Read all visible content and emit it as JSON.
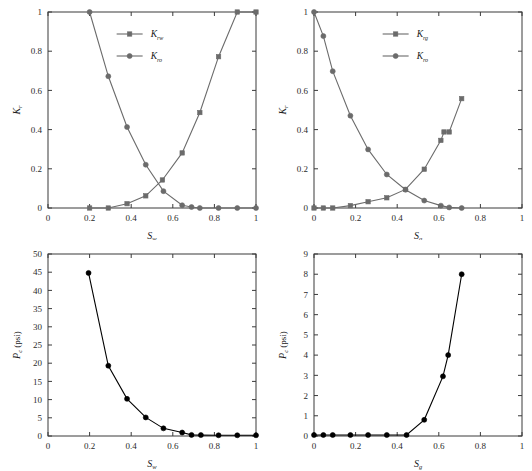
{
  "figure": {
    "panels": [
      "top-left",
      "top-right",
      "bottom-left",
      "bottom-right"
    ]
  },
  "chart_data": [
    {
      "id": "water-oil-relative-permeability",
      "type": "line",
      "title": "",
      "xlabel": "S",
      "xlabel_sub": "w",
      "ylabel": "K",
      "ylabel_sub": "r",
      "xlim": [
        0,
        1
      ],
      "ylim": [
        0,
        1
      ],
      "xticks": [
        0,
        0.2,
        0.4,
        0.6,
        0.8,
        1
      ],
      "xticklabels": [
        "0",
        "0.2",
        "0.4",
        "0.6",
        "0.8",
        "1"
      ],
      "yticks": [
        0,
        0.2,
        0.4,
        0.6,
        0.8,
        1
      ],
      "yticklabels": [
        "0",
        "0.2",
        "0.4",
        "0.6",
        "0.8",
        "1"
      ],
      "grid": false,
      "legend_position": "upper-center",
      "series": [
        {
          "name": "K",
          "name_sub": "rw",
          "marker": "square",
          "color": "#6b6b6b",
          "x": [
            0.2,
            0.29,
            0.38,
            0.47,
            0.55,
            0.645,
            0.73,
            0.82,
            0.91,
            1.0
          ],
          "y": [
            0.0,
            0.0,
            0.022,
            0.062,
            0.143,
            0.281,
            0.487,
            0.772,
            1.0,
            1.0
          ]
        },
        {
          "name": "K",
          "name_sub": "ro",
          "marker": "circle",
          "color": "#6b6b6b",
          "x": [
            0.2,
            0.29,
            0.38,
            0.47,
            0.555,
            0.645,
            0.69,
            0.73,
            0.82,
            0.91,
            1.0
          ],
          "y": [
            1.0,
            0.672,
            0.413,
            0.221,
            0.086,
            0.014,
            0.005,
            0.0,
            0.0,
            0.0,
            0.0
          ]
        }
      ]
    },
    {
      "id": "gas-oil-relative-permeability",
      "type": "line",
      "title": "",
      "xlabel": "S",
      "xlabel_sub": "g",
      "ylabel": "K",
      "ylabel_sub": "r",
      "xlim": [
        0,
        1
      ],
      "ylim": [
        0,
        1
      ],
      "xticks": [
        0,
        0.2,
        0.4,
        0.6,
        0.8,
        1
      ],
      "xticklabels": [
        "0",
        "0.2",
        "0.4",
        "0.6",
        "0.8",
        "1"
      ],
      "yticks": [
        0,
        0.2,
        0.4,
        0.6,
        0.8,
        1
      ],
      "yticklabels": [
        "0",
        "0.2",
        "0.4",
        "0.6",
        "0.8",
        "1"
      ],
      "grid": false,
      "legend_position": "upper-center",
      "series": [
        {
          "name": "K",
          "name_sub": "rg",
          "marker": "square",
          "color": "#6b6b6b",
          "x": [
            0.0,
            0.045,
            0.09,
            0.175,
            0.26,
            0.35,
            0.44,
            0.53,
            0.61,
            0.625,
            0.65,
            0.71
          ],
          "y": [
            0.0,
            0.0,
            0.0,
            0.012,
            0.032,
            0.052,
            0.095,
            0.198,
            0.345,
            0.388,
            0.388,
            0.558
          ]
        },
        {
          "name": "K",
          "name_sub": "ro",
          "marker": "circle",
          "color": "#6b6b6b",
          "x": [
            0.0,
            0.045,
            0.09,
            0.175,
            0.26,
            0.35,
            0.44,
            0.53,
            0.61,
            0.65,
            0.71
          ],
          "y": [
            1.0,
            0.877,
            0.698,
            0.471,
            0.299,
            0.171,
            0.093,
            0.038,
            0.012,
            0.003,
            0.0
          ]
        }
      ]
    },
    {
      "id": "water-capillary-pressure",
      "type": "line",
      "title": "",
      "xlabel": "S",
      "xlabel_sub": "w",
      "ylabel": "P",
      "ylabel_sub": "c",
      "yunit": "(psi)",
      "xlim": [
        0,
        1
      ],
      "ylim": [
        0,
        50
      ],
      "xticks": [
        0,
        0.2,
        0.4,
        0.6,
        0.8,
        1
      ],
      "xticklabels": [
        "0",
        "0.2",
        "0.4",
        "0.6",
        "0.8",
        "1"
      ],
      "yticks": [
        0,
        5,
        10,
        15,
        20,
        25,
        30,
        35,
        40,
        45,
        50
      ],
      "yticklabels": [
        "0",
        "5",
        "10",
        "15",
        "20",
        "25",
        "30",
        "35",
        "40",
        "45",
        "50"
      ],
      "grid": false,
      "legend_position": "none",
      "series": [
        {
          "name": "Pc",
          "marker": "circle",
          "color": "#000000",
          "x": [
            0.195,
            0.29,
            0.38,
            0.47,
            0.555,
            0.645,
            0.69,
            0.735,
            0.82,
            0.91,
            1.0
          ],
          "y": [
            44.8,
            19.3,
            10.2,
            5.1,
            2.1,
            0.95,
            0.3,
            0.25,
            0.2,
            0.2,
            0.2
          ]
        }
      ]
    },
    {
      "id": "gas-capillary-pressure",
      "type": "line",
      "title": "",
      "xlabel": "S",
      "xlabel_sub": "g",
      "ylabel": "P",
      "ylabel_sub": "c",
      "yunit": "(psi)",
      "xlim": [
        0,
        1
      ],
      "ylim": [
        0,
        9
      ],
      "xticks": [
        0,
        0.2,
        0.4,
        0.6,
        0.8,
        1
      ],
      "xticklabels": [
        "0",
        "0.2",
        "0.4",
        "0.6",
        "0.8",
        "1"
      ],
      "yticks": [
        0,
        1,
        2,
        3,
        4,
        5,
        6,
        7,
        8,
        9
      ],
      "yticklabels": [
        "0",
        "1",
        "2",
        "3",
        "4",
        "5",
        "6",
        "7",
        "8",
        "9"
      ],
      "grid": false,
      "legend_position": "none",
      "series": [
        {
          "name": "Pc",
          "marker": "circle",
          "color": "#000000",
          "x": [
            0.0,
            0.045,
            0.09,
            0.175,
            0.26,
            0.35,
            0.445,
            0.53,
            0.62,
            0.645,
            0.71
          ],
          "y": [
            0.05,
            0.05,
            0.05,
            0.05,
            0.05,
            0.05,
            0.05,
            0.8,
            2.95,
            4.0,
            8.0
          ]
        }
      ]
    }
  ]
}
